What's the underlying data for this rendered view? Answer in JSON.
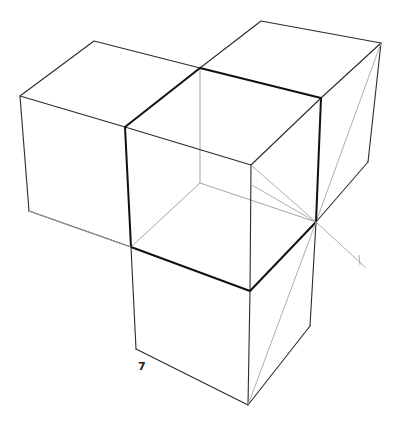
{
  "figure": {
    "type": "line-drawing",
    "label": "7",
    "colors": {
      "background": "#ffffff",
      "edge": "#2b2b2b",
      "bold_edge": "#111111",
      "construction_line": "#a5a5a5"
    }
  },
  "cubes": [
    {
      "name": "left-cube"
    },
    {
      "name": "back-right-cube"
    },
    {
      "name": "center-cube"
    },
    {
      "name": "bottom-cube"
    }
  ]
}
